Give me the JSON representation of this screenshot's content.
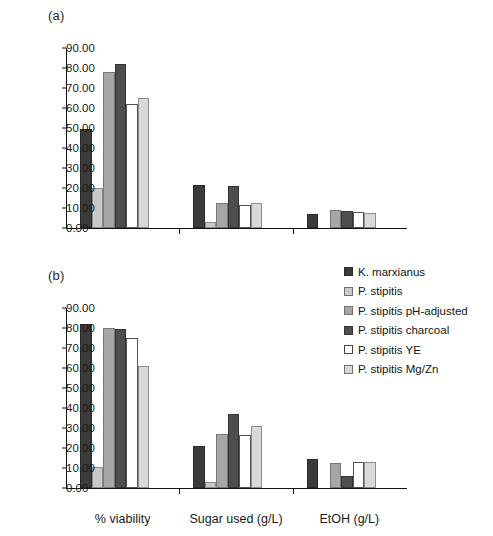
{
  "figure": {
    "panel_a_label": "(a)",
    "panel_b_label": "(b)"
  },
  "legend": {
    "position": "right-middle",
    "entries": [
      {
        "label": "K. marxianus",
        "color": "#3b3b3b"
      },
      {
        "label": "P. stipitis",
        "color": "#c9c9c9"
      },
      {
        "label": "P. stipitis pH-adjusted",
        "color": "#a6a6a6"
      },
      {
        "label": "P. stipitis charcoal",
        "color": "#4e4e4e"
      },
      {
        "label": "P. stipitis YE",
        "color": "#ffffff"
      },
      {
        "label": "P. stipitis Mg/Zn",
        "color": "#d9d9d9"
      }
    ]
  },
  "chart_data": [
    {
      "type": "bar",
      "title": "(a)",
      "xlabel": "",
      "ylabel": "",
      "ylim": [
        0,
        90
      ],
      "yticks": [
        "0.00",
        "10.00",
        "20.00",
        "30.00",
        "40.00",
        "50.00",
        "60.00",
        "70.00",
        "80.00",
        "90.00"
      ],
      "grid": false,
      "categories": [
        "% viability",
        "Sugar used (g/L)",
        "EtOH (g/L)"
      ],
      "series": [
        {
          "name": "K. marxianus",
          "values": [
            49.5,
            21.5,
            7.2
          ]
        },
        {
          "name": "P. stipitis",
          "values": [
            20.0,
            3.2,
            0
          ]
        },
        {
          "name": "P. stipitis pH-adjusted",
          "values": [
            78.0,
            12.5,
            9.0
          ]
        },
        {
          "name": "P. stipitis charcoal",
          "values": [
            82.0,
            21.0,
            8.6
          ]
        },
        {
          "name": "P. stipitis YE",
          "values": [
            62.0,
            11.5,
            8.0
          ]
        },
        {
          "name": "P. stipitis Mg/Zn",
          "values": [
            65.0,
            12.3,
            7.7
          ]
        }
      ]
    },
    {
      "type": "bar",
      "title": "(b)",
      "xlabel": "",
      "ylabel": "",
      "ylim": [
        0,
        90
      ],
      "yticks": [
        "0.00",
        "10.00",
        "20.00",
        "30.00",
        "40.00",
        "50.00",
        "60.00",
        "70.00",
        "80.00",
        "90.00"
      ],
      "grid": false,
      "categories": [
        "% viability",
        "Sugar used (g/L)",
        "EtOH (g/L)"
      ],
      "series": [
        {
          "name": "K. marxianus",
          "values": [
            82.0,
            20.8,
            14.5
          ]
        },
        {
          "name": "P. stipitis",
          "values": [
            10.5,
            3.0,
            0
          ]
        },
        {
          "name": "P. stipitis pH-adjusted",
          "values": [
            80.0,
            27.2,
            12.7
          ]
        },
        {
          "name": "P. stipitis charcoal",
          "values": [
            79.5,
            37.0,
            5.8
          ]
        },
        {
          "name": "P. stipitis YE",
          "values": [
            75.0,
            26.5,
            13.0
          ]
        },
        {
          "name": "P. stipitis Mg/Zn",
          "values": [
            61.0,
            30.8,
            13.0
          ]
        }
      ]
    }
  ],
  "axis": {
    "category_labels": [
      "% viability",
      "Sugar used (g/L)",
      "EtOH (g/L)"
    ]
  }
}
